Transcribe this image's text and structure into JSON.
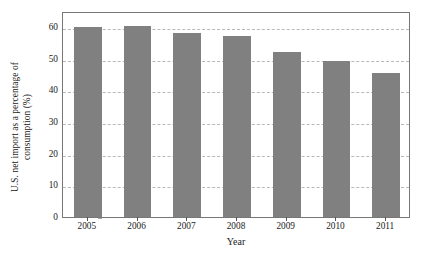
{
  "chart_data": {
    "type": "bar",
    "title": "",
    "xlabel": "Year",
    "ylabel": "U.S. net import as a percentage of consumption (%)",
    "ylabel_line1": "U.S. net import as a percentage of",
    "ylabel_line2": "consumption (%)",
    "categories": [
      "2005",
      "2006",
      "2007",
      "2008",
      "2009",
      "2010",
      "2011"
    ],
    "values": [
      60.0,
      60.2,
      58.1,
      57.1,
      52.1,
      49.3,
      45.3
    ],
    "ylim": [
      0,
      65
    ],
    "yticks": [
      0,
      10,
      20,
      30,
      40,
      50,
      60
    ],
    "ytick_labels": [
      "0",
      "10",
      "20",
      "30",
      "40",
      "50",
      "60"
    ],
    "grid": true,
    "grid_axis": "y",
    "grid_style": "dashed",
    "legend": "none",
    "bar_color": "#808080",
    "grid_color": "#b9b9b9",
    "frame_color": "#777777",
    "background_color": "#ffffff"
  }
}
